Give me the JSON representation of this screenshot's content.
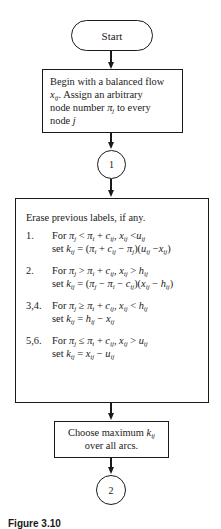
{
  "flowchart": {
    "start": {
      "label": "Start"
    },
    "step_init": {
      "line1": "Begin with a balanced flow",
      "line2_var": "x",
      "line2_sub": "ij",
      "line2_rest": ". Assign an arbitrary",
      "line3_pre": "node number ",
      "line3_var": "π",
      "line3_sub": "j",
      "line3_post": " to every",
      "line4_pre": "node ",
      "line4_var": "j"
    },
    "connector_1": {
      "label": "1"
    },
    "step_labels": {
      "heading": "Erase previous labels, if any.",
      "rules": [
        {
          "num": "1.",
          "cond": "For πj < πi + cij, xij < uij",
          "set": "set kij = (πi + cij − πj)(uij − xij)"
        },
        {
          "num": "2.",
          "cond": "For πj > πi + cij, xij > hij",
          "set": "set kij = (πj − πi − cij)(xij − hij)"
        },
        {
          "num": "3,4.",
          "cond": "For πj ≥ πi + cij, xij < hij",
          "set": "set kij = hij − xij"
        },
        {
          "num": "5,6.",
          "cond": "For πj ≤ πi + cij, xij > uij",
          "set": "set kij = xij − uij"
        }
      ]
    },
    "step_choose": {
      "line1_pre": "Choose maximum ",
      "line1_var": "k",
      "line1_sub": "ij",
      "line2": "over all arcs."
    },
    "connector_2": {
      "label": "2"
    }
  },
  "caption": "Figure 3.10"
}
